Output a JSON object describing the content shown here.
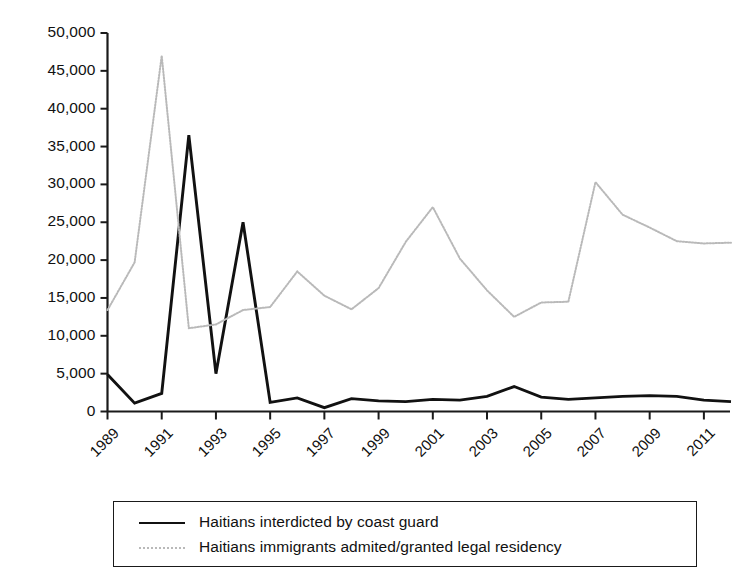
{
  "chart_data": {
    "type": "line",
    "title": "",
    "subtitle": "",
    "xlabel": "",
    "ylabel": "",
    "xlim": [
      1989,
      2012
    ],
    "ylim": [
      0,
      50000
    ],
    "grid": false,
    "legend_position": "bottom",
    "y_ticks": [
      0,
      5000,
      10000,
      15000,
      20000,
      25000,
      30000,
      35000,
      40000,
      45000,
      50000
    ],
    "y_tick_labels": [
      "0",
      "5,000",
      "10,000",
      "15,000",
      "20,000",
      "25,000",
      "30,000",
      "35,000",
      "40,000",
      "45,000",
      "50,000"
    ],
    "x_ticks": [
      1989,
      1991,
      1993,
      1995,
      1997,
      1999,
      2001,
      2003,
      2005,
      2007,
      2009,
      2011
    ],
    "x_tick_labels": [
      "1989",
      "1991",
      "1993",
      "1995",
      "1997",
      "1999",
      "2001",
      "2003",
      "2005",
      "2007",
      "2009",
      "2011"
    ],
    "x": [
      1989,
      1990,
      1991,
      1992,
      1993,
      1994,
      1995,
      1996,
      1997,
      1998,
      1999,
      2000,
      2001,
      2002,
      2003,
      2004,
      2005,
      2006,
      2007,
      2008,
      2009,
      2010,
      2011,
      2012
    ],
    "series": [
      {
        "name": "Haitians interdicted by coast guard",
        "color": "#111111",
        "style": "solid",
        "values": [
          4900,
          1100,
          2400,
          36500,
          5000,
          25000,
          1200,
          1800,
          500,
          1700,
          1400,
          1300,
          1600,
          1500,
          2000,
          3300,
          1900,
          1600,
          1800,
          2000,
          2100,
          2000,
          1500,
          1300
        ]
      },
      {
        "name": "Haitians immigrants admited/granted legal residency",
        "color": "#b9b9b9",
        "style": "dotted",
        "values": [
          13400,
          19700,
          47000,
          11000,
          11500,
          13400,
          13800,
          18500,
          15300,
          13500,
          16300,
          22400,
          27000,
          20200,
          16000,
          12500,
          14400,
          14500,
          30300,
          26000,
          24300,
          22500,
          22200,
          22300
        ]
      }
    ],
    "annotations": []
  },
  "legend": {
    "items": [
      {
        "label": "Haitians interdicted by coast guard",
        "swatch": "solid-line-swatch"
      },
      {
        "label": "Haitians immigrants admited/granted legal residency",
        "swatch": "dotted-line-swatch"
      }
    ]
  },
  "colors": {
    "axis": "#1a1a1a",
    "series_black": "#111111",
    "series_gray": "#b9b9b9",
    "background": "#ffffff"
  }
}
